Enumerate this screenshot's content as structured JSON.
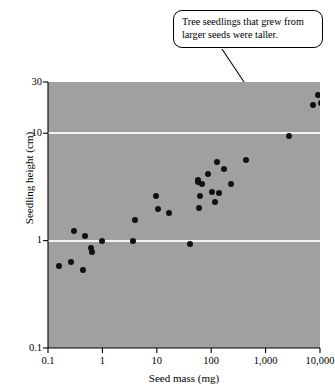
{
  "callout": {
    "text": "Tree seedlings that grew from larger seeds were taller.",
    "leader_icon": "leader-line"
  },
  "chart_data": {
    "type": "scatter",
    "title": "",
    "subtitle": "",
    "xlabel": "Seed mass (mg)",
    "ylabel": "Seedling height (cm)",
    "xscale": "log",
    "yscale": "log",
    "xlim": [
      0.1,
      10000
    ],
    "ylim": [
      0.1,
      30
    ],
    "xticks": [
      0.1,
      1,
      10,
      100,
      1000,
      10000
    ],
    "xticklabels": [
      "0.1",
      "1",
      "10",
      "100",
      "1,000",
      "10,000"
    ],
    "yticks": [
      0.1,
      1,
      10,
      30
    ],
    "yticklabels": [
      "0.1",
      "1",
      "10",
      "30"
    ],
    "gridlines_y": [
      1,
      10
    ],
    "grid": "horizontal-only",
    "legend": "none",
    "plot_background": "#a0a0a0",
    "gridline_color": "#f2f2f2",
    "marker_color": "#101010",
    "marker_shape": "circle",
    "point_count": 35,
    "annotation": "Tree seedlings that grew from larger seeds were taller.",
    "points": [
      {
        "x": 0.16,
        "y": 0.58
      },
      {
        "x": 0.26,
        "y": 0.63
      },
      {
        "x": 0.3,
        "y": 1.22
      },
      {
        "x": 0.44,
        "y": 0.53
      },
      {
        "x": 0.48,
        "y": 1.1
      },
      {
        "x": 0.62,
        "y": 0.85
      },
      {
        "x": 0.64,
        "y": 0.78
      },
      {
        "x": 0.98,
        "y": 1.0
      },
      {
        "x": 3.6,
        "y": 1.0
      },
      {
        "x": 3.9,
        "y": 1.55
      },
      {
        "x": 9.5,
        "y": 2.6
      },
      {
        "x": 10.5,
        "y": 1.95
      },
      {
        "x": 17.0,
        "y": 1.8
      },
      {
        "x": 41.0,
        "y": 0.93
      },
      {
        "x": 56.0,
        "y": 3.7
      },
      {
        "x": 58.0,
        "y": 3.55
      },
      {
        "x": 60.0,
        "y": 2.0
      },
      {
        "x": 63.0,
        "y": 2.6
      },
      {
        "x": 68.0,
        "y": 3.4
      },
      {
        "x": 88.0,
        "y": 4.2
      },
      {
        "x": 105.0,
        "y": 2.85
      },
      {
        "x": 115.0,
        "y": 2.3
      },
      {
        "x": 130.0,
        "y": 5.4
      },
      {
        "x": 140.0,
        "y": 2.75
      },
      {
        "x": 170.0,
        "y": 4.6
      },
      {
        "x": 230.0,
        "y": 3.4
      },
      {
        "x": 440.0,
        "y": 5.6
      },
      {
        "x": 2700.0,
        "y": 9.5
      },
      {
        "x": 7400.0,
        "y": 18.5
      },
      {
        "x": 9000.0,
        "y": 22.5
      },
      {
        "x": 10500.0,
        "y": 19.0
      }
    ]
  }
}
